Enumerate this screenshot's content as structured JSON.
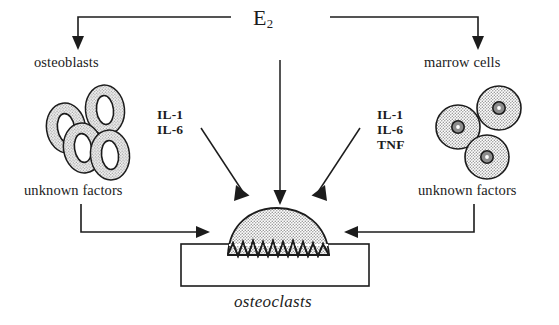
{
  "figure": {
    "title_label": "E2",
    "title_base": "E",
    "title_sub": "2",
    "background_color": "#ffffff",
    "ink_color": "#1c1c1c",
    "cell_fill_color": "#d6d6d6",
    "nucleus_fill_color": "#ffffff",
    "marrow_nucleus_fill_color": "#8c8c8c",
    "osteoclast_fill_color": "#d9d9d9"
  },
  "labels": {
    "osteoblasts": "osteoblasts",
    "marrow_cells": "marrow cells",
    "unknown_factors_left": "unknown factors",
    "unknown_factors_right": "unknown factors",
    "osteoclasts": "osteoclasts"
  },
  "cytokines_left": {
    "lines": [
      "IL-1",
      "IL-6"
    ]
  },
  "cytokines_right": {
    "lines": [
      "IL-1",
      "IL-6",
      "TNF"
    ]
  },
  "arrows": [
    {
      "name": "e2-to-osteoblasts",
      "type": "elbow-down-left",
      "from": "E2",
      "to": "osteoblasts"
    },
    {
      "name": "e2-to-marrow-cells",
      "type": "elbow-down-right",
      "from": "E2",
      "to": "marrow cells"
    },
    {
      "name": "e2-to-osteoclasts",
      "type": "straight-down",
      "from": "E2",
      "to": "osteoclasts"
    },
    {
      "name": "cytokines-left-to-osteoclasts",
      "type": "diagonal-down-right",
      "from": "IL-1 / IL-6",
      "to": "osteoclasts"
    },
    {
      "name": "cytokines-right-to-osteoclasts",
      "type": "diagonal-down-left",
      "from": "IL-1 / IL-6 / TNF",
      "to": "osteoclasts"
    },
    {
      "name": "unknown-factors-left-to-osteoclasts",
      "type": "elbow-right",
      "from": "unknown factors",
      "to": "osteoclasts"
    },
    {
      "name": "unknown-factors-right-to-osteoclasts",
      "type": "elbow-left",
      "from": "unknown factors",
      "to": "osteoclasts"
    }
  ],
  "cells": {
    "osteoblast_count": 4,
    "marrow_cell_count": 3,
    "osteoblast_shape": "oval",
    "marrow_cell_shape": "circle"
  }
}
